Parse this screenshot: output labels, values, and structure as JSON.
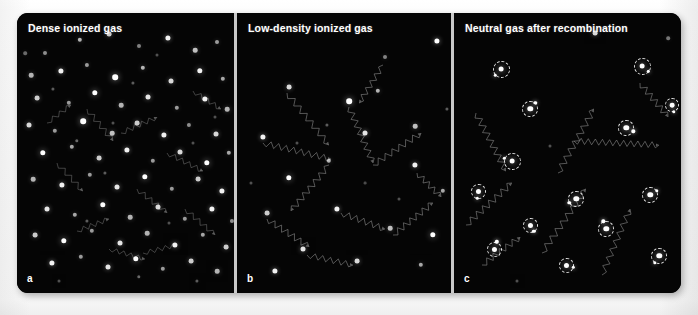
{
  "figure": {
    "background_color": "#ffffff",
    "plate_color": "#050505",
    "gutter_color": "#c9c9c9",
    "dot_color": "#ffffff",
    "photon_color": "#8a8a8a",
    "ring_color": "#e8e8e8"
  },
  "panels": [
    {
      "id": "a",
      "letter": "a",
      "title": "Dense ionized gas",
      "kind": "dense-ionized",
      "particles": [
        [
          28,
          40,
          2.0,
          0.55
        ],
        [
          63,
          27,
          2.2,
          0.7
        ],
        [
          92,
          21,
          2.4,
          0.8
        ],
        [
          122,
          33,
          2.0,
          0.5
        ],
        [
          151,
          25,
          2.6,
          0.95
        ],
        [
          178,
          37,
          2.3,
          0.75
        ],
        [
          200,
          29,
          2.0,
          0.6
        ],
        [
          14,
          62,
          2.3,
          0.7
        ],
        [
          44,
          58,
          2.6,
          0.95
        ],
        [
          70,
          52,
          2.1,
          0.6
        ],
        [
          98,
          64,
          2.8,
          1.0
        ],
        [
          126,
          55,
          2.2,
          0.7
        ],
        [
          154,
          68,
          2.5,
          0.85
        ],
        [
          183,
          58,
          2.7,
          0.95
        ],
        [
          206,
          66,
          2.2,
          0.65
        ],
        [
          20,
          85,
          2.4,
          0.8
        ],
        [
          52,
          90,
          2.2,
          0.6
        ],
        [
          78,
          80,
          2.7,
          1.0
        ],
        [
          104,
          92,
          2.3,
          0.7
        ],
        [
          131,
          84,
          2.5,
          0.9
        ],
        [
          160,
          95,
          2.2,
          0.6
        ],
        [
          188,
          86,
          2.6,
          0.95
        ],
        [
          210,
          96,
          2.3,
          0.7
        ],
        [
          12,
          112,
          2.5,
          0.85
        ],
        [
          38,
          118,
          2.2,
          0.6
        ],
        [
          66,
          108,
          2.8,
          1.0
        ],
        [
          95,
          120,
          2.3,
          0.75
        ],
        [
          120,
          110,
          2.4,
          0.8
        ],
        [
          147,
          122,
          2.6,
          0.95
        ],
        [
          172,
          112,
          2.1,
          0.55
        ],
        [
          199,
          121,
          2.5,
          0.85
        ],
        [
          26,
          140,
          2.7,
          1.0
        ],
        [
          55,
          134,
          2.2,
          0.65
        ],
        [
          82,
          145,
          2.4,
          0.8
        ],
        [
          110,
          137,
          2.6,
          0.95
        ],
        [
          136,
          148,
          2.2,
          0.6
        ],
        [
          163,
          139,
          2.5,
          0.85
        ],
        [
          190,
          150,
          2.7,
          1.0
        ],
        [
          212,
          140,
          2.2,
          0.65
        ],
        [
          16,
          166,
          2.3,
          0.7
        ],
        [
          45,
          172,
          2.6,
          0.95
        ],
        [
          73,
          162,
          2.2,
          0.6
        ],
        [
          100,
          174,
          2.5,
          0.9
        ],
        [
          128,
          164,
          2.7,
          1.0
        ],
        [
          155,
          176,
          2.2,
          0.6
        ],
        [
          181,
          166,
          2.4,
          0.8
        ],
        [
          205,
          178,
          2.6,
          0.95
        ],
        [
          30,
          196,
          2.5,
          0.9
        ],
        [
          58,
          202,
          2.2,
          0.65
        ],
        [
          86,
          192,
          2.7,
          1.0
        ],
        [
          113,
          204,
          2.3,
          0.7
        ],
        [
          141,
          194,
          2.5,
          0.85
        ],
        [
          168,
          206,
          2.2,
          0.6
        ],
        [
          195,
          196,
          2.6,
          0.95
        ],
        [
          215,
          208,
          2.1,
          0.55
        ],
        [
          18,
          222,
          2.4,
          0.8
        ],
        [
          47,
          228,
          2.7,
          1.0
        ],
        [
          75,
          218,
          2.2,
          0.6
        ],
        [
          103,
          230,
          2.5,
          0.9
        ],
        [
          130,
          220,
          2.3,
          0.7
        ],
        [
          158,
          232,
          2.6,
          0.95
        ],
        [
          186,
          222,
          2.2,
          0.65
        ],
        [
          209,
          234,
          2.4,
          0.8
        ],
        [
          35,
          250,
          2.6,
          0.95
        ],
        [
          64,
          244,
          2.2,
          0.6
        ],
        [
          91,
          254,
          2.5,
          0.9
        ],
        [
          119,
          246,
          2.7,
          1.0
        ],
        [
          146,
          256,
          2.2,
          0.6
        ],
        [
          174,
          248,
          2.4,
          0.8
        ],
        [
          200,
          258,
          2.3,
          0.7
        ],
        [
          8,
          40,
          1.8,
          0.4
        ],
        [
          116,
          70,
          1.6,
          0.35
        ],
        [
          60,
          128,
          1.7,
          0.4
        ],
        [
          176,
          130,
          1.5,
          0.3
        ],
        [
          88,
          160,
          1.6,
          0.35
        ],
        [
          140,
          42,
          1.5,
          0.3
        ],
        [
          36,
          76,
          1.6,
          0.35
        ],
        [
          198,
          104,
          1.5,
          0.3
        ],
        [
          70,
          208,
          1.6,
          0.35
        ],
        [
          152,
          210,
          1.5,
          0.3
        ],
        [
          122,
          264,
          1.7,
          0.4
        ],
        [
          42,
          268,
          1.5,
          0.3
        ],
        [
          180,
          268,
          1.6,
          0.35
        ],
        [
          96,
          110,
          1.5,
          0.3
        ]
      ],
      "photon_paths": [
        {
          "x1": 70,
          "y1": 96,
          "x2": 96,
          "y2": 128,
          "amp": 2.6,
          "n": 9
        },
        {
          "x1": 104,
          "y1": 120,
          "x2": 140,
          "y2": 104,
          "amp": 2.4,
          "n": 10
        },
        {
          "x1": 40,
          "y1": 150,
          "x2": 66,
          "y2": 178,
          "amp": 2.5,
          "n": 8
        },
        {
          "x1": 150,
          "y1": 140,
          "x2": 186,
          "y2": 158,
          "amp": 2.4,
          "n": 10
        },
        {
          "x1": 120,
          "y1": 176,
          "x2": 150,
          "y2": 200,
          "amp": 2.5,
          "n": 9
        },
        {
          "x1": 60,
          "y1": 218,
          "x2": 92,
          "y2": 206,
          "amp": 2.3,
          "n": 9
        },
        {
          "x1": 168,
          "y1": 196,
          "x2": 198,
          "y2": 222,
          "amp": 2.4,
          "n": 9
        },
        {
          "x1": 92,
          "y1": 236,
          "x2": 128,
          "y2": 246,
          "amp": 2.2,
          "n": 10
        },
        {
          "x1": 30,
          "y1": 110,
          "x2": 54,
          "y2": 92,
          "amp": 2.2,
          "n": 7
        },
        {
          "x1": 176,
          "y1": 78,
          "x2": 204,
          "y2": 96,
          "amp": 2.3,
          "n": 8
        },
        {
          "x1": 126,
          "y1": 240,
          "x2": 160,
          "y2": 232,
          "amp": 2.2,
          "n": 9
        }
      ]
    },
    {
      "id": "b",
      "letter": "b",
      "title": "Low-density ionized gas",
      "kind": "low-density-ionized",
      "particles": [
        [
          200,
          28,
          2.6,
          1.0
        ],
        [
          52,
          74,
          2.4,
          0.85
        ],
        [
          112,
          88,
          2.8,
          1.0
        ],
        [
          141,
          78,
          2.2,
          0.7
        ],
        [
          26,
          124,
          2.6,
          0.95
        ],
        [
          128,
          120,
          2.5,
          0.9
        ],
        [
          178,
          113,
          2.3,
          0.75
        ],
        [
          92,
          148,
          2.2,
          0.7
        ],
        [
          178,
          152,
          2.6,
          0.95
        ],
        [
          52,
          165,
          2.7,
          1.0
        ],
        [
          206,
          178,
          2.2,
          0.65
        ],
        [
          30,
          200,
          2.4,
          0.8
        ],
        [
          100,
          196,
          2.6,
          0.95
        ],
        [
          153,
          215,
          2.3,
          0.75
        ],
        [
          196,
          222,
          2.7,
          1.0
        ],
        [
          66,
          236,
          2.5,
          0.9
        ],
        [
          120,
          248,
          2.4,
          0.85
        ],
        [
          184,
          252,
          2.2,
          0.65
        ],
        [
          38,
          258,
          2.6,
          0.95
        ],
        [
          148,
          44,
          2.0,
          0.5
        ],
        [
          90,
          112,
          1.6,
          0.35
        ],
        [
          162,
          186,
          1.5,
          0.3
        ],
        [
          60,
          130,
          1.5,
          0.3
        ],
        [
          210,
          96,
          1.6,
          0.35
        ],
        [
          14,
          170,
          1.5,
          0.3
        ],
        [
          128,
          170,
          1.4,
          0.28
        ]
      ],
      "photon_paths": [
        {
          "x1": 50,
          "y1": 80,
          "x2": 92,
          "y2": 132,
          "amp": 3.0,
          "n": 14
        },
        {
          "x1": 112,
          "y1": 94,
          "x2": 136,
          "y2": 150,
          "amp": 3.0,
          "n": 15
        },
        {
          "x1": 26,
          "y1": 130,
          "x2": 94,
          "y2": 146,
          "amp": 3.0,
          "n": 18
        },
        {
          "x1": 92,
          "y1": 152,
          "x2": 54,
          "y2": 198,
          "amp": 3.0,
          "n": 14
        },
        {
          "x1": 136,
          "y1": 152,
          "x2": 184,
          "y2": 120,
          "amp": 3.0,
          "n": 14
        },
        {
          "x1": 30,
          "y1": 206,
          "x2": 72,
          "y2": 234,
          "amp": 3.0,
          "n": 13
        },
        {
          "x1": 104,
          "y1": 200,
          "x2": 148,
          "y2": 216,
          "amp": 3.0,
          "n": 12
        },
        {
          "x1": 156,
          "y1": 222,
          "x2": 196,
          "y2": 190,
          "amp": 3.0,
          "n": 13
        },
        {
          "x1": 180,
          "y1": 160,
          "x2": 204,
          "y2": 184,
          "amp": 2.8,
          "n": 9
        },
        {
          "x1": 70,
          "y1": 242,
          "x2": 116,
          "y2": 252,
          "amp": 2.8,
          "n": 12
        },
        {
          "x1": 146,
          "y1": 52,
          "x2": 122,
          "y2": 90,
          "amp": 2.8,
          "n": 11
        }
      ]
    },
    {
      "id": "c",
      "letter": "c",
      "title": "Neutral gas after recombination",
      "kind": "neutral-recombined",
      "atoms": [
        [
          47,
          56,
          8.5,
          135
        ],
        [
          188,
          53,
          8.5,
          40
        ],
        [
          76,
          96,
          8.0,
          310
        ],
        [
          172,
          115,
          8.0,
          25
        ],
        [
          58,
          148,
          8.5,
          200
        ],
        [
          24,
          178,
          7.5,
          95
        ],
        [
          122,
          186,
          8.0,
          150
        ],
        [
          196,
          182,
          8.0,
          330
        ],
        [
          76,
          212,
          7.5,
          60
        ],
        [
          152,
          216,
          8.0,
          250
        ],
        [
          205,
          243,
          8.0,
          120
        ],
        [
          112,
          252,
          7.5,
          20
        ],
        [
          40,
          236,
          7.5,
          290
        ],
        [
          218,
          92,
          7.0,
          75
        ]
      ],
      "particles": [
        [
          141,
          20,
          2.4,
          0.85
        ],
        [
          214,
          25,
          1.8,
          0.45
        ],
        [
          96,
          133,
          1.5,
          0.3
        ],
        [
          63,
          268,
          1.5,
          0.3
        ]
      ],
      "photon_paths": [
        {
          "x1": 22,
          "y1": 100,
          "x2": 52,
          "y2": 158,
          "amp": 3.2,
          "n": 16
        },
        {
          "x1": 104,
          "y1": 160,
          "x2": 140,
          "y2": 96,
          "amp": 3.2,
          "n": 17
        },
        {
          "x1": 120,
          "y1": 128,
          "x2": 205,
          "y2": 132,
          "amp": 3.0,
          "n": 24
        },
        {
          "x1": 12,
          "y1": 212,
          "x2": 58,
          "y2": 170,
          "amp": 3.2,
          "n": 15
        },
        {
          "x1": 88,
          "y1": 240,
          "x2": 132,
          "y2": 176,
          "amp": 3.2,
          "n": 17
        },
        {
          "x1": 148,
          "y1": 262,
          "x2": 176,
          "y2": 196,
          "amp": 3.0,
          "n": 16
        },
        {
          "x1": 28,
          "y1": 252,
          "x2": 66,
          "y2": 224,
          "amp": 3.0,
          "n": 12
        },
        {
          "x1": 186,
          "y1": 70,
          "x2": 214,
          "y2": 104,
          "amp": 3.0,
          "n": 11
        }
      ]
    }
  ]
}
